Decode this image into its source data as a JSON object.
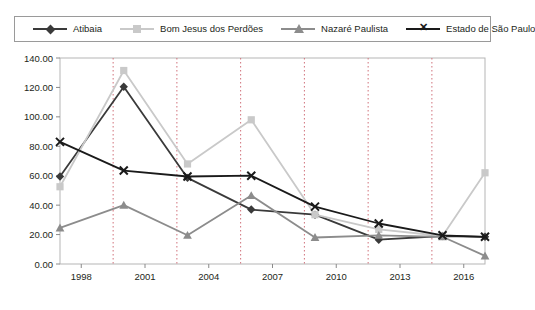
{
  "legend": {
    "items": [
      {
        "label": "Atibaia",
        "color": "#3a3a3a",
        "marker": "diamond"
      },
      {
        "label": "Bom Jesus dos Perdões",
        "color": "#c9c9c9",
        "marker": "square"
      },
      {
        "label": "Nazaré Paulista",
        "color": "#8c8c8c",
        "marker": "triangle"
      },
      {
        "label": "Estado de São Paulo",
        "color": "#1a1a1a",
        "marker": "x"
      }
    ]
  },
  "chart_data": {
    "type": "line",
    "title": "",
    "xlabel": "",
    "ylabel": "",
    "x": [
      1997,
      1998,
      1999,
      2000,
      2001,
      2002,
      2003,
      2004,
      2005,
      2006,
      2007,
      2008,
      2009,
      2010,
      2011,
      2012,
      2013,
      2014,
      2015,
      2016,
      2017
    ],
    "x_ticks": [
      "1998",
      "2001",
      "2004",
      "2007",
      "2010",
      "2013",
      "2016"
    ],
    "x_tick_values": [
      1998,
      2001,
      2004,
      2007,
      2010,
      2013,
      2016
    ],
    "y_ticks": [
      "0.00",
      "20.00",
      "40.00",
      "60.00",
      "80.00",
      "100.00",
      "120.00",
      "140.00"
    ],
    "y_tick_values": [
      0,
      20,
      40,
      60,
      80,
      100,
      120,
      140
    ],
    "ylim": [
      0,
      140
    ],
    "xlim": [
      1997,
      2017
    ],
    "grid": "vertical-dotted",
    "legend_position": "top",
    "series": [
      {
        "name": "Atibaia",
        "color": "#3a3a3a",
        "marker": "diamond",
        "x": [
          1997,
          2000,
          2003,
          2006,
          2009,
          2012,
          2015,
          2017
        ],
        "values": [
          59.5,
          120.5,
          58.5,
          37.0,
          33.5,
          16.5,
          19.0,
          18.5
        ]
      },
      {
        "name": "Bom Jesus dos Perdões",
        "color": "#c9c9c9",
        "marker": "square",
        "x": [
          1997,
          2000,
          2003,
          2006,
          2009,
          2012,
          2015,
          2017
        ],
        "values": [
          52.5,
          131.5,
          68.0,
          98.0,
          33.5,
          23.5,
          19.0,
          62.0
        ]
      },
      {
        "name": "Nazaré Paulista",
        "color": "#8c8c8c",
        "marker": "triangle",
        "x": [
          1997,
          2000,
          2003,
          2006,
          2009,
          2012,
          2015,
          2017
        ],
        "values": [
          24.5,
          40.0,
          19.5,
          46.5,
          18.0,
          19.5,
          18.5,
          5.5
        ]
      },
      {
        "name": "Estado de São Paulo",
        "color": "#1a1a1a",
        "marker": "x",
        "x": [
          1997,
          2000,
          2003,
          2006,
          2009,
          2012,
          2015,
          2017
        ],
        "values": [
          83.0,
          63.5,
          59.5,
          60.0,
          39.0,
          27.5,
          19.5,
          18.5
        ]
      }
    ]
  }
}
